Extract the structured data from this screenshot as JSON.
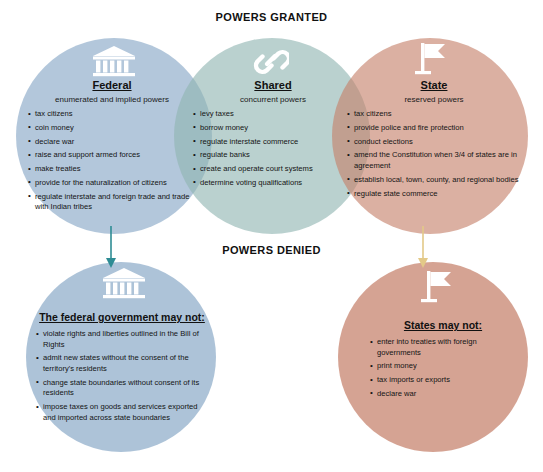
{
  "headings": {
    "granted": "POWERS GRANTED",
    "denied": "POWERS DENIED"
  },
  "colors": {
    "federal": "#96b2cd",
    "shared": "#8fb5b2",
    "state": "#c58069",
    "arrow_federal": "#2e8c94",
    "arrow_state": "#e8cf8a",
    "icon": "#ffffff",
    "text": "#141414",
    "background": "#ffffff"
  },
  "granted": {
    "federal": {
      "icon": "classical-building-icon",
      "title": "Federal",
      "subtitle": "enumerated and implied powers",
      "items": [
        "tax citizens",
        "coin money",
        "declare war",
        "raise and support armed forces",
        "make treaties",
        "provide for the naturalization of citizens",
        "regulate interstate and foreign trade and trade with Indian tribes"
      ]
    },
    "shared": {
      "icon": "chain-link-icon",
      "title": "Shared",
      "subtitle": "concurrent powers",
      "items": [
        "levy taxes",
        "borrow money",
        "regulate interstate commerce",
        "regulate banks",
        "create and operate court systems",
        "determine voting qualifications"
      ]
    },
    "state": {
      "icon": "flag-icon",
      "title": "State",
      "subtitle": "reserved powers",
      "items": [
        "tax citizens",
        "provide police and fire protection",
        "conduct elections",
        "amend the Constitution when 3/4 of states are in agreement",
        "establish local, town, county, and regional bodies",
        "regulate state commerce"
      ]
    }
  },
  "denied": {
    "federal": {
      "icon": "classical-building-icon",
      "title": "The federal government may not:",
      "items": [
        "violate rights and liberties outlined in the Bill of Rights",
        "admit new states without the consent of the territory's residents",
        "change state boundaries without consent of its residents",
        "impose taxes on goods and services exported and imported across state boundaries"
      ]
    },
    "state": {
      "icon": "flag-icon",
      "title": "States may not:",
      "items": [
        "enter into treaties with foreign governments",
        "print money",
        "tax imports or exports",
        "declare war"
      ]
    }
  }
}
